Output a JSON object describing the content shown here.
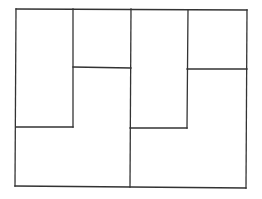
{
  "diagram": {
    "title": "",
    "stroke_color": "#333333",
    "background": "#ffffff",
    "outer_rect": {
      "x1": 16,
      "y1": 9,
      "x2": 247,
      "y2": 188
    },
    "lines": [
      {
        "id": "outer-top",
        "x1": 16,
        "y1": 9,
        "x2": 247,
        "y2": 10
      },
      {
        "id": "outer-left",
        "x1": 16,
        "y1": 9,
        "x2": 15,
        "y2": 186
      },
      {
        "id": "outer-bottom",
        "x1": 15,
        "y1": 186,
        "x2": 246,
        "y2": 188
      },
      {
        "id": "outer-right",
        "x1": 247,
        "y1": 10,
        "x2": 246,
        "y2": 188
      },
      {
        "id": "left-half-inner-vertical",
        "x1": 73,
        "y1": 9,
        "x2": 73,
        "y2": 127
      },
      {
        "id": "left-half-square-bottom",
        "x1": 73,
        "y1": 67,
        "x2": 131,
        "y2": 68
      },
      {
        "id": "left-half-tall-rect-bottom",
        "x1": 16,
        "y1": 127,
        "x2": 73,
        "y2": 127
      },
      {
        "id": "center-divider",
        "x1": 131,
        "y1": 9,
        "x2": 130,
        "y2": 187
      },
      {
        "id": "right-half-inner-vertical",
        "x1": 188,
        "y1": 10,
        "x2": 187,
        "y2": 128
      },
      {
        "id": "right-half-square-bottom",
        "x1": 187,
        "y1": 69,
        "x2": 247,
        "y2": 69
      },
      {
        "id": "right-half-tall-rect-bottom",
        "x1": 130,
        "y1": 128,
        "x2": 187,
        "y2": 128
      }
    ]
  }
}
